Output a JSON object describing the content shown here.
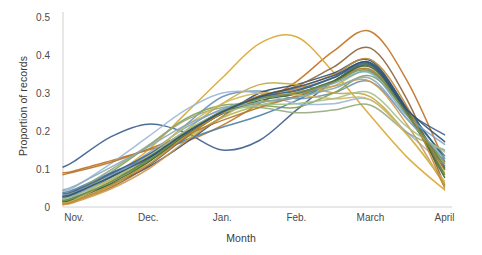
{
  "chart_data": {
    "type": "line",
    "title": "",
    "subtitle": "",
    "xlabel": "Month",
    "ylabel": "Proportion of records",
    "x_tick_labels": [
      "Nov.",
      "Dec.",
      "Jan.",
      "Feb.",
      "March",
      "April"
    ],
    "x_tick_values": [
      0,
      1,
      2,
      3,
      4,
      5
    ],
    "y_tick_labels": [
      "0",
      "0.1",
      "0.2",
      "0.3",
      "0.4",
      "0.5"
    ],
    "y_tick_values": [
      0,
      0.1,
      0.2,
      0.3,
      0.4,
      0.5
    ],
    "xlim": [
      -0.15,
      5.1
    ],
    "ylim": [
      0,
      0.52
    ],
    "grid": false,
    "legend": "none",
    "x": [
      -0.15,
      0,
      0.5,
      1,
      1.5,
      2,
      2.5,
      3,
      3.5,
      4,
      4.5,
      5
    ],
    "series": [
      {
        "name": "series-1",
        "color": "#3b5d8c",
        "values": [
          0.105,
          0.12,
          0.185,
          0.218,
          0.196,
          0.15,
          0.175,
          0.255,
          0.33,
          0.372,
          0.25,
          0.105
        ]
      },
      {
        "name": "series-2",
        "color": "#c1711f",
        "values": [
          0.09,
          0.095,
          0.122,
          0.15,
          0.172,
          0.215,
          0.272,
          0.33,
          0.41,
          0.462,
          0.33,
          0.12
        ]
      },
      {
        "name": "series-3",
        "color": "#d9a62e",
        "values": [
          0.012,
          0.02,
          0.08,
          0.15,
          0.245,
          0.34,
          0.43,
          0.448,
          0.355,
          0.24,
          0.13,
          0.045
        ]
      },
      {
        "name": "series-4",
        "color": "#6b8fb5",
        "values": [
          0.03,
          0.038,
          0.085,
          0.135,
          0.215,
          0.29,
          0.305,
          0.285,
          0.3,
          0.33,
          0.23,
          0.12
        ]
      },
      {
        "name": "series-5",
        "color": "#7f9f55",
        "values": [
          0.018,
          0.028,
          0.092,
          0.16,
          0.232,
          0.268,
          0.268,
          0.262,
          0.3,
          0.345,
          0.245,
          0.115
        ]
      },
      {
        "name": "series-6",
        "color": "#2f4f6f",
        "values": [
          0.02,
          0.026,
          0.06,
          0.105,
          0.168,
          0.238,
          0.3,
          0.322,
          0.352,
          0.385,
          0.255,
          0.1
        ]
      },
      {
        "name": "series-7",
        "color": "#a8b94a",
        "values": [
          0.024,
          0.032,
          0.072,
          0.12,
          0.18,
          0.235,
          0.268,
          0.288,
          0.318,
          0.355,
          0.24,
          0.09
        ]
      },
      {
        "name": "series-8",
        "color": "#8c6239",
        "values": [
          0.01,
          0.016,
          0.052,
          0.108,
          0.182,
          0.248,
          0.292,
          0.318,
          0.368,
          0.418,
          0.28,
          0.058
        ]
      },
      {
        "name": "series-9",
        "color": "#4a7fa8",
        "values": [
          0.038,
          0.046,
          0.09,
          0.13,
          0.176,
          0.21,
          0.24,
          0.28,
          0.33,
          0.372,
          0.248,
          0.135
        ]
      },
      {
        "name": "series-10",
        "color": "#c4a83c",
        "values": [
          0.008,
          0.014,
          0.055,
          0.118,
          0.2,
          0.272,
          0.322,
          0.322,
          0.3,
          0.29,
          0.19,
          0.062
        ]
      },
      {
        "name": "series-11",
        "color": "#9bb7d4",
        "values": [
          0.042,
          0.052,
          0.115,
          0.185,
          0.255,
          0.3,
          0.3,
          0.272,
          0.272,
          0.282,
          0.195,
          0.11
        ]
      },
      {
        "name": "series-12",
        "color": "#5f7f3f",
        "values": [
          0.015,
          0.022,
          0.068,
          0.125,
          0.195,
          0.25,
          0.275,
          0.29,
          0.33,
          0.372,
          0.252,
          0.085
        ]
      },
      {
        "name": "series-13",
        "color": "#2d5a7b",
        "values": [
          0.026,
          0.034,
          0.078,
          0.128,
          0.19,
          0.248,
          0.288,
          0.305,
          0.34,
          0.38,
          0.258,
          0.128
        ]
      },
      {
        "name": "series-14",
        "color": "#cf9a4f",
        "values": [
          0.006,
          0.012,
          0.048,
          0.1,
          0.172,
          0.238,
          0.285,
          0.302,
          0.318,
          0.33,
          0.215,
          0.055
        ]
      },
      {
        "name": "series-15",
        "color": "#93a97e",
        "values": [
          0.03,
          0.04,
          0.098,
          0.162,
          0.228,
          0.262,
          0.262,
          0.248,
          0.255,
          0.268,
          0.195,
          0.15
        ]
      },
      {
        "name": "series-16",
        "color": "#b5752a",
        "values": [
          0.085,
          0.092,
          0.118,
          0.152,
          0.19,
          0.228,
          0.262,
          0.292,
          0.33,
          0.362,
          0.245,
          0.098
        ]
      },
      {
        "name": "series-17",
        "color": "#7ba7c9",
        "values": [
          0.022,
          0.03,
          0.082,
          0.142,
          0.208,
          0.258,
          0.285,
          0.298,
          0.325,
          0.352,
          0.238,
          0.165
        ]
      },
      {
        "name": "series-18",
        "color": "#3f6636",
        "values": [
          0.014,
          0.02,
          0.062,
          0.118,
          0.188,
          0.245,
          0.28,
          0.298,
          0.332,
          0.368,
          0.245,
          0.078
        ]
      },
      {
        "name": "series-19",
        "color": "#d4b85c",
        "values": [
          0.01,
          0.018,
          0.07,
          0.135,
          0.212,
          0.272,
          0.3,
          0.295,
          0.285,
          0.282,
          0.188,
          0.068
        ]
      },
      {
        "name": "series-20",
        "color": "#40628a",
        "values": [
          0.034,
          0.042,
          0.088,
          0.138,
          0.198,
          0.252,
          0.288,
          0.308,
          0.34,
          0.375,
          0.252,
          0.19
        ]
      },
      {
        "name": "series-21",
        "color": "#a3c08a",
        "values": [
          0.02,
          0.028,
          0.074,
          0.132,
          0.2,
          0.248,
          0.268,
          0.272,
          0.285,
          0.3,
          0.21,
          0.145
        ]
      },
      {
        "name": "series-22",
        "color": "#8aa8b8",
        "values": [
          0.045,
          0.055,
          0.105,
          0.158,
          0.215,
          0.255,
          0.275,
          0.288,
          0.312,
          0.338,
          0.23,
          0.128
        ]
      },
      {
        "name": "series-23",
        "color": "#bf8b35",
        "values": [
          0.008,
          0.015,
          0.058,
          0.112,
          0.185,
          0.248,
          0.292,
          0.312,
          0.348,
          0.388,
          0.262,
          0.05
        ]
      },
      {
        "name": "series-24",
        "color": "#6e8f4e",
        "values": [
          0.016,
          0.024,
          0.066,
          0.122,
          0.192,
          0.252,
          0.285,
          0.3,
          0.328,
          0.358,
          0.242,
          0.108
        ]
      },
      {
        "name": "series-25",
        "color": "#34506e",
        "values": [
          0.028,
          0.036,
          0.08,
          0.13,
          0.194,
          0.25,
          0.29,
          0.315,
          0.345,
          0.378,
          0.255,
          0.172
        ]
      }
    ]
  },
  "axes": {
    "axis_color": "#d0d0d0",
    "tick_text_color": "#4a4a4a",
    "title_text_color": "#3b3b3b",
    "background": "#ffffff"
  }
}
